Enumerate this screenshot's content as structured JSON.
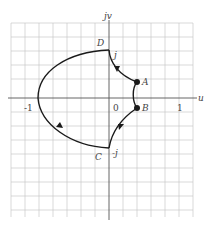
{
  "diagram": {
    "axes": {
      "horizontal_label": "u",
      "vertical_label": "jv",
      "origin_label": "0",
      "ticks": [
        {
          "label": "-1",
          "value": -1
        },
        {
          "label": "1",
          "value": 1
        }
      ],
      "imag_ticks": [
        {
          "label": "j",
          "value": 1
        },
        {
          "label": "-j",
          "value": -1
        }
      ]
    },
    "points": [
      {
        "name": "D",
        "u": 0,
        "v": 1
      },
      {
        "name": "A",
        "u": 0.2,
        "v": 0.25
      },
      {
        "name": "B",
        "u": 0.2,
        "v": -0.25
      },
      {
        "name": "C",
        "u": 0,
        "v": -1
      }
    ],
    "path_description": "D → A → B → C → large arc through -1 back to D",
    "colors": {
      "curve": "#1a1a1a",
      "grid": "#c8c8c8",
      "axis": "#555555",
      "background": "#ffffff"
    }
  }
}
